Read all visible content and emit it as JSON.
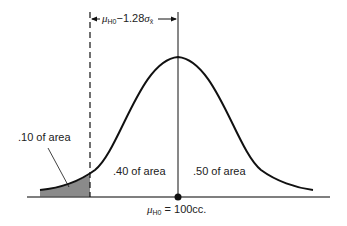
{
  "diagram": {
    "type": "normal-distribution-curve",
    "top_label": {
      "mu": "μ",
      "sub": "H0",
      "rest": "−1.28",
      "sigma": "σ",
      "sigma_sub": "x̄"
    },
    "left_tail_label": ".10 of area",
    "middle_left_label": ".40 of area",
    "middle_right_label": ".50 of area",
    "axis_label": {
      "mu": "μ",
      "sub": "H0",
      "rest": " = 100cc."
    },
    "colors": {
      "line": "#111111",
      "shade": "#8a8a8a",
      "axis": "#555555"
    }
  }
}
